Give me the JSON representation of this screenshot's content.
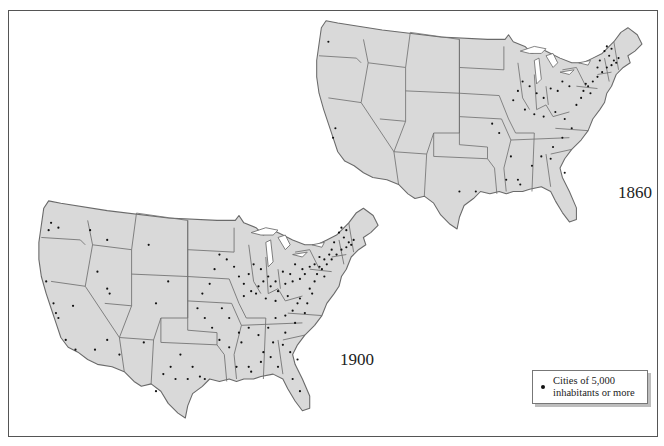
{
  "figure": {
    "type": "historical-dot-map",
    "maps": [
      {
        "id": "map-1860",
        "year_label": "1860",
        "position": "upper-right"
      },
      {
        "id": "map-1900",
        "year_label": "1900",
        "position": "lower-left"
      }
    ]
  },
  "legend": {
    "symbol": "dot",
    "text_line1": "Cities of 5,000",
    "text_line2": "inhabitants or more"
  },
  "colors": {
    "land": "#d9d9d9",
    "border": "#6a6a6a",
    "city_dot": "#111111",
    "background": "#ffffff"
  }
}
